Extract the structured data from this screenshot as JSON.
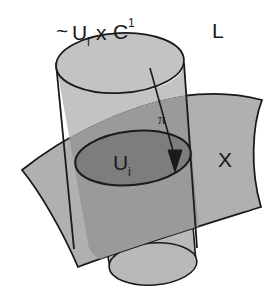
{
  "figure": {
    "type": "line-bundle-local-trivialization-diagram",
    "background_color": "#ffffff",
    "stroke_color": "#1a1a1a",
    "labels": {
      "bundle_chart_tilde": "~",
      "bundle_chart_base": "U",
      "bundle_chart_base_sub": "i",
      "bundle_chart_times": "x",
      "bundle_chart_fiber": "C",
      "bundle_chart_fiber_sup": "1",
      "total_space": "L",
      "base_space": "X",
      "projection": "π",
      "open_set": "U",
      "open_set_sub": "i"
    },
    "colors": {
      "cylinder_light": "#c3c3c3",
      "cylinder_below": "#b9b9b9",
      "surface": "#b0b0b0",
      "overlap_medium": "#9a9a9a",
      "disk_dark": "#7d7d7d",
      "outline": "#1a1a1a"
    },
    "elements": [
      {
        "name": "cylinder-upper",
        "role": "total space of line bundle over U_i"
      },
      {
        "name": "cylinder-top-ellipse",
        "role": "top rim of cylinder"
      },
      {
        "name": "base-surface",
        "role": "manifold X"
      },
      {
        "name": "open-set-disk",
        "role": "open set U_i in X"
      },
      {
        "name": "cylinder-lower",
        "role": "cylinder continuing below surface"
      },
      {
        "name": "cylinder-bottom-ellipse",
        "role": "bottom rim of cylinder"
      },
      {
        "name": "projection-arrow",
        "role": "bundle projection pi"
      }
    ]
  }
}
